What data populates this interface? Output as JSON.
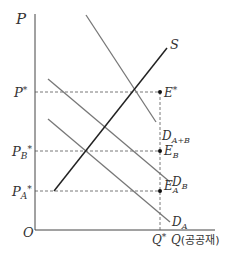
{
  "diagram": {
    "axes": {
      "y_label": "P",
      "x_label": "Q",
      "x_label_suffix": "(공공재)",
      "origin_label": "O"
    },
    "price_levels": [
      {
        "label": "P*",
        "base": "P",
        "sup": "*",
        "sub": ""
      },
      {
        "label": "P_B*",
        "base": "P",
        "sub": "B",
        "sup": "*"
      },
      {
        "label": "P_A*",
        "base": "P",
        "sub": "A",
        "sup": "*"
      }
    ],
    "quantity_level": {
      "label": "Q*",
      "base": "Q",
      "sup": "*"
    },
    "curves": [
      {
        "name": "S",
        "base": "S",
        "sub": ""
      },
      {
        "name": "D_A+B",
        "base": "D",
        "sub": "A+B"
      },
      {
        "name": "D_B",
        "base": "D",
        "sub": "B"
      },
      {
        "name": "D_A",
        "base": "D",
        "sub": "A"
      }
    ],
    "points": [
      {
        "name": "E*",
        "base": "E",
        "sup": "*",
        "sub": ""
      },
      {
        "name": "E_B",
        "base": "E",
        "sub": "B",
        "sup": ""
      },
      {
        "name": "E_A",
        "base": "E",
        "sub": "A",
        "sup": ""
      }
    ],
    "colors": {
      "axis": "#444444",
      "supply": "#222222",
      "demand": "#777777",
      "dashed": "#555555",
      "text": "#333333"
    }
  }
}
